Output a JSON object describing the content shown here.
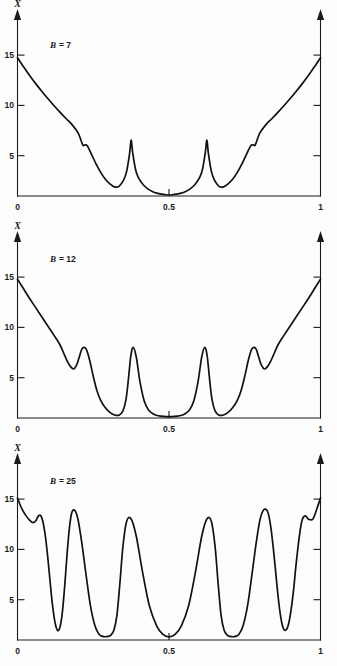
{
  "figure": {
    "background_color": "#fdfdfd",
    "curve_color": "#111111",
    "axis_color": "#1a1a1a"
  },
  "chart_data": [
    {
      "type": "line",
      "title": "",
      "annotation_symbol": "B",
      "annotation_equals": "= 7",
      "annotation_full": "B = 7",
      "parameter_name": "B",
      "parameter_value": 7,
      "xlabel": "",
      "ylabel": "X",
      "xlim": [
        0,
        1
      ],
      "ylim": [
        0,
        17.5
      ],
      "xticks": [
        0,
        0.5,
        1
      ],
      "xticklabels": [
        "0",
        "0.5",
        "1"
      ],
      "yticks": [
        5,
        10,
        15
      ],
      "yticklabels": [
        "5",
        "10",
        "15"
      ],
      "grid": false,
      "legend": "none",
      "x": [
        0.0,
        0.02,
        0.04,
        0.06,
        0.08,
        0.1,
        0.12,
        0.14,
        0.16,
        0.18,
        0.2,
        0.215,
        0.22,
        0.23,
        0.245,
        0.26,
        0.275,
        0.29,
        0.305,
        0.32,
        0.335,
        0.35,
        0.36,
        0.37,
        0.375,
        0.38,
        0.39,
        0.4,
        0.415,
        0.43,
        0.445,
        0.46,
        0.475,
        0.49,
        0.5,
        0.51,
        0.525,
        0.54,
        0.555,
        0.57,
        0.585,
        0.6,
        0.61,
        0.62,
        0.625,
        0.63,
        0.64,
        0.65,
        0.665,
        0.68,
        0.695,
        0.71,
        0.725,
        0.74,
        0.755,
        0.77,
        0.78,
        0.785,
        0.8,
        0.82,
        0.84,
        0.86,
        0.88,
        0.9,
        0.92,
        0.94,
        0.96,
        0.98,
        1.0
      ],
      "y": [
        13.6,
        12.7,
        11.85,
        11.05,
        10.3,
        9.58,
        8.9,
        8.25,
        7.62,
        7.02,
        6.2,
        5.05,
        5.0,
        4.95,
        4.05,
        3.1,
        2.3,
        1.65,
        1.2,
        0.9,
        0.95,
        1.55,
        2.4,
        4.2,
        5.5,
        4.3,
        2.55,
        1.75,
        1.1,
        0.7,
        0.45,
        0.28,
        0.18,
        0.12,
        0.1,
        0.12,
        0.18,
        0.28,
        0.45,
        0.7,
        1.1,
        1.75,
        2.55,
        4.3,
        5.5,
        4.2,
        2.4,
        1.55,
        0.95,
        0.9,
        1.2,
        1.65,
        2.3,
        3.1,
        4.05,
        4.95,
        5.0,
        5.05,
        6.2,
        7.02,
        7.62,
        8.25,
        8.9,
        9.58,
        10.3,
        11.05,
        11.85,
        12.7,
        13.6
      ]
    },
    {
      "type": "line",
      "title": "",
      "annotation_symbol": "B",
      "annotation_equals": "= 12",
      "annotation_full": "B = 12",
      "parameter_name": "B",
      "parameter_value": 12,
      "xlabel": "",
      "ylabel": "X",
      "xlim": [
        0,
        1
      ],
      "ylim": [
        0,
        17.5
      ],
      "xticks": [
        0,
        0.5,
        1
      ],
      "xticklabels": [
        "0",
        "0.5",
        "1"
      ],
      "yticks": [
        5,
        10,
        15
      ],
      "yticklabels": [
        "5",
        "10",
        "15"
      ],
      "grid": false,
      "legend": "none",
      "x": [
        0.0,
        0.02,
        0.04,
        0.06,
        0.08,
        0.1,
        0.12,
        0.14,
        0.155,
        0.165,
        0.175,
        0.185,
        0.195,
        0.205,
        0.212,
        0.22,
        0.228,
        0.238,
        0.25,
        0.262,
        0.275,
        0.29,
        0.305,
        0.32,
        0.335,
        0.348,
        0.358,
        0.366,
        0.374,
        0.382,
        0.392,
        0.404,
        0.418,
        0.432,
        0.448,
        0.465,
        0.482,
        0.5,
        0.518,
        0.535,
        0.552,
        0.568,
        0.582,
        0.596,
        0.608,
        0.618,
        0.626,
        0.634,
        0.642,
        0.652,
        0.665,
        0.68,
        0.695,
        0.71,
        0.725,
        0.738,
        0.75,
        0.762,
        0.772,
        0.78,
        0.788,
        0.795,
        0.805,
        0.815,
        0.825,
        0.835,
        0.845,
        0.86,
        0.88,
        0.9,
        0.92,
        0.94,
        0.96,
        0.98,
        1.0
      ],
      "y": [
        13.65,
        12.7,
        11.75,
        10.85,
        9.95,
        9.05,
        8.15,
        7.2,
        6.2,
        5.55,
        5.05,
        4.82,
        5.2,
        6.1,
        6.75,
        6.95,
        6.7,
        5.7,
        4.1,
        2.7,
        1.7,
        1.0,
        0.55,
        0.3,
        0.28,
        0.7,
        1.8,
        3.8,
        6.1,
        6.95,
        6.0,
        3.6,
        1.7,
        0.8,
        0.4,
        0.22,
        0.15,
        0.13,
        0.15,
        0.22,
        0.4,
        0.8,
        1.7,
        3.6,
        6.0,
        6.95,
        6.1,
        3.8,
        1.8,
        0.7,
        0.28,
        0.3,
        0.55,
        1.0,
        1.7,
        2.7,
        4.1,
        5.7,
        6.7,
        6.95,
        6.75,
        6.1,
        5.2,
        4.82,
        5.05,
        5.55,
        6.2,
        7.2,
        8.15,
        9.05,
        9.95,
        10.85,
        11.75,
        12.7,
        13.65
      ]
    },
    {
      "type": "line",
      "title": "",
      "annotation_symbol": "B",
      "annotation_equals": "= 25",
      "annotation_full": "B = 25",
      "parameter_name": "B",
      "parameter_value": 25,
      "xlabel": "",
      "ylabel": "X",
      "xlim": [
        0,
        1
      ],
      "ylim": [
        0,
        17.5
      ],
      "xticks": [
        0,
        0.5,
        1
      ],
      "xticklabels": [
        "0",
        "0.5",
        "1"
      ],
      "yticks": [
        5,
        10,
        15
      ],
      "yticklabels": [
        "5",
        "10",
        "15"
      ],
      "grid": false,
      "legend": "none",
      "x": [
        0.0,
        0.012,
        0.025,
        0.038,
        0.05,
        0.06,
        0.068,
        0.076,
        0.084,
        0.092,
        0.1,
        0.108,
        0.116,
        0.124,
        0.132,
        0.14,
        0.148,
        0.156,
        0.164,
        0.172,
        0.18,
        0.19,
        0.2,
        0.212,
        0.225,
        0.24,
        0.255,
        0.268,
        0.278,
        0.288,
        0.298,
        0.308,
        0.318,
        0.328,
        0.338,
        0.348,
        0.36,
        0.375,
        0.392,
        0.412,
        0.435,
        0.46,
        0.48,
        0.5,
        0.52,
        0.54,
        0.565,
        0.588,
        0.608,
        0.625,
        0.64,
        0.652,
        0.662,
        0.672,
        0.682,
        0.692,
        0.702,
        0.712,
        0.722,
        0.732,
        0.745,
        0.76,
        0.775,
        0.788,
        0.8,
        0.81,
        0.82,
        0.828,
        0.836,
        0.844,
        0.852,
        0.86,
        0.868,
        0.876,
        0.884,
        0.892,
        0.9,
        0.91,
        0.92,
        0.932,
        0.94,
        0.95,
        0.962,
        0.975,
        0.988,
        1.0
      ],
      "y": [
        13.95,
        13.05,
        12.35,
        11.85,
        11.55,
        11.7,
        12.15,
        12.25,
        11.6,
        10.2,
        8.1,
        5.6,
        3.3,
        1.7,
        0.95,
        1.25,
        2.7,
        5.4,
        8.6,
        11.2,
        12.6,
        12.7,
        11.8,
        9.6,
        6.7,
        3.5,
        1.45,
        0.62,
        0.38,
        0.32,
        0.35,
        0.48,
        0.95,
        2.4,
        5.6,
        9.2,
        11.65,
        11.9,
        10.2,
        6.8,
        3.4,
        1.35,
        0.55,
        0.3,
        0.55,
        1.35,
        3.4,
        6.8,
        10.2,
        11.9,
        11.65,
        9.2,
        5.6,
        2.4,
        0.95,
        0.48,
        0.35,
        0.32,
        0.38,
        0.62,
        1.45,
        3.5,
        6.7,
        9.6,
        11.8,
        12.7,
        12.85,
        12.4,
        11.1,
        9.1,
        6.7,
        4.3,
        2.4,
        1.25,
        0.95,
        1.3,
        2.4,
        4.6,
        7.6,
        10.6,
        11.85,
        12.2,
        11.85,
        11.9,
        12.9,
        13.95
      ]
    }
  ]
}
